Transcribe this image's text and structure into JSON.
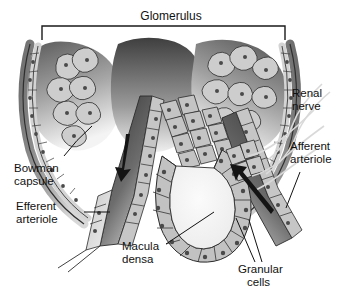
{
  "figure": {
    "name": "juxtaglomerular-apparatus-diagram",
    "background_color": "#ffffff",
    "width": 342,
    "height": 290
  },
  "title": {
    "text": "Glomerulus",
    "bracket": {
      "left": 42,
      "right": 285,
      "top": 26,
      "tip": 40
    }
  },
  "labels": {
    "renal_nerve": {
      "line1": "Renal",
      "line2": "nerve"
    },
    "afferent_arteriole": {
      "line1": "Afferent",
      "line2": "arteriole"
    },
    "bowman_capsule": {
      "line1": "Bowman",
      "line2": "capsule"
    },
    "efferent_arteriole": {
      "line1": "Efferent",
      "line2": "arteriole"
    },
    "macula_densa": {
      "line1": "Macula",
      "line2": "densa"
    },
    "granular_cells": {
      "line1": "Granular",
      "line2": "cells"
    }
  },
  "colors": {
    "ink": "#111111",
    "outline": "#2b2b2b",
    "cell_fill": "#b9b9b9",
    "cell_fill_light": "#cfcfcf",
    "nucleus": "#4a4a4a",
    "lumen_light": "#f2f2f2",
    "vessel_dark": "#4a4a4a",
    "vessel_darker": "#3a3a3a",
    "capsule_band": "#8c8c8c",
    "nerve": "#dddddd",
    "background": "#ffffff"
  },
  "flow_arrows": [
    {
      "name": "efferent-flow-arrow",
      "direction": "down-left",
      "from": [
        129,
        136
      ],
      "to": [
        120,
        178
      ]
    },
    {
      "name": "afferent-flow-arrow",
      "direction": "up-left",
      "from": [
        271,
        212
      ],
      "to": [
        232,
        165
      ]
    }
  ]
}
